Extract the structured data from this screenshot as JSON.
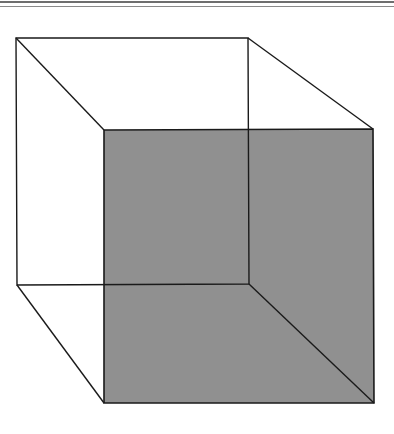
{
  "figure": {
    "title": "",
    "colors": {
      "background": "#ffffff",
      "stroke": "#1a1a1a",
      "front_face_fill": "#909090",
      "header_rule": "#6e6e6e"
    },
    "back_face": {
      "top_left": [
        16,
        38
      ],
      "top_right": [
        248,
        38
      ],
      "bottom_right": [
        249,
        284
      ],
      "bottom_left": [
        17,
        285
      ]
    },
    "front_face": {
      "top_left": [
        104,
        130
      ],
      "top_right": [
        373,
        129
      ],
      "bottom_right": [
        374,
        403
      ],
      "bottom_left": [
        104,
        403
      ]
    }
  }
}
